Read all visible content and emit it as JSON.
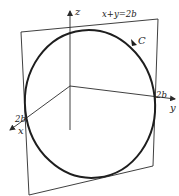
{
  "diagram": {
    "plane_label": "x+y=2b",
    "curve_label": "C",
    "axes": {
      "x_label": "x",
      "y_label": "y",
      "z_label": "z"
    },
    "intercepts": {
      "x_intercept_label": "2b",
      "y_intercept_label": "2b"
    },
    "colors": {
      "stroke": "#2a2a2a",
      "curve": "#1e1e1e",
      "background": "#ffffff"
    }
  }
}
